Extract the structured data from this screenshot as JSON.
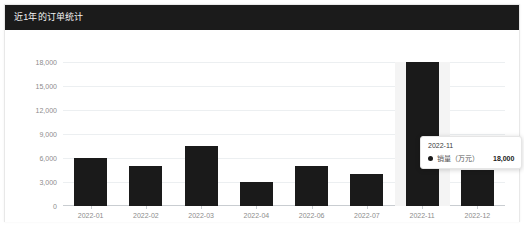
{
  "card": {
    "title": "近1年的订单统计",
    "header_color": "#1b1b1b",
    "body_color": "#ffffff"
  },
  "chart_data": {
    "type": "bar",
    "title": "近1年的订单统计",
    "xlabel": "",
    "ylabel": "",
    "ylim": [
      0,
      18000
    ],
    "yticks": [
      "0",
      "3,000",
      "6,000",
      "9,000",
      "12,000",
      "15,000",
      "18,000"
    ],
    "ytick_values": [
      0,
      3000,
      6000,
      9000,
      12000,
      15000,
      18000
    ],
    "grid": true,
    "legend": "none",
    "series_name": "销量（万元）",
    "bar_color": "#1a1a1a",
    "categories": [
      "2022-01",
      "2022-02",
      "2022-03",
      "2022-04",
      "2022-06",
      "2022-07",
      "2022-11",
      "2022-12"
    ],
    "values": [
      6000,
      5000,
      7500,
      3000,
      5000,
      4000,
      18000,
      4500
    ],
    "highlighted_category": "2022-11"
  },
  "tooltip": {
    "title": "2022-11",
    "series_label": "销量（万元）",
    "value": "18,000",
    "marker_color": "#1a1a1a"
  }
}
